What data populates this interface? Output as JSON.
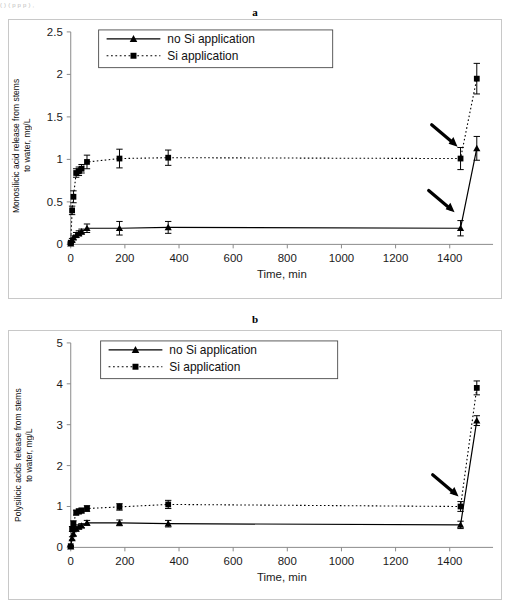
{
  "page": {
    "cut_off_header_text": "(  )              (                                                                           p               p                                  p                                                                 )   ,       "
  },
  "panels": [
    {
      "label": "a",
      "ylabel_line1": "Monosilicic acid release from stems",
      "ylabel_line2": "to water, mg/L"
    },
    {
      "label": "b",
      "ylabel_line1": "Polysilicic acids release from stems",
      "ylabel_line2": "to water, mg/L"
    }
  ],
  "chart_data": [
    {
      "type": "line",
      "panel": "a",
      "title": "a",
      "xlabel": "Time, min",
      "ylabel": "Monosilicic acid release from stems to water, mg/L",
      "xlim": [
        0,
        1560
      ],
      "ylim": [
        0,
        2.5
      ],
      "xticks": [
        0,
        200,
        400,
        600,
        800,
        1000,
        1200,
        1400
      ],
      "xtick_labels": [
        "0",
        "200",
        "400",
        "600",
        "800",
        "1000",
        "1200",
        "1400"
      ],
      "yticks": [
        0,
        0.5,
        1,
        1.5,
        2,
        2.5
      ],
      "ytick_labels": [
        "0",
        "0.5",
        "1",
        "1.5",
        "2",
        "2.5"
      ],
      "grid": false,
      "legend_position": "upper-left-inside",
      "series": [
        {
          "name": "no Si application",
          "marker": "triangle",
          "line_style": "solid",
          "color": "#000000",
          "x": [
            0,
            5,
            10,
            20,
            30,
            40,
            60,
            180,
            360,
            1440,
            1500
          ],
          "y": [
            0.01,
            0.05,
            0.08,
            0.11,
            0.13,
            0.15,
            0.19,
            0.19,
            0.2,
            0.19,
            1.13
          ],
          "yerr": [
            0.01,
            0.02,
            0.02,
            0.03,
            0.03,
            0.03,
            0.05,
            0.08,
            0.07,
            0.09,
            0.14
          ]
        },
        {
          "name": "Si application",
          "marker": "square",
          "line_style": "dotted",
          "color": "#000000",
          "x": [
            0,
            5,
            10,
            20,
            30,
            40,
            60,
            180,
            360,
            1440,
            1500
          ],
          "y": [
            0.02,
            0.4,
            0.56,
            0.84,
            0.86,
            0.89,
            0.97,
            1.01,
            1.02,
            1.01,
            1.95
          ],
          "yerr": [
            0.01,
            0.05,
            0.07,
            0.05,
            0.05,
            0.05,
            0.08,
            0.11,
            0.09,
            0.13,
            0.18
          ]
        }
      ],
      "annotations": [
        {
          "type": "arrow",
          "points_to": "Si application point at 1440 min",
          "x": 1440,
          "y": 1.01
        },
        {
          "type": "arrow",
          "points_to": "no Si application point at 1440 min",
          "x": 1440,
          "y": 0.19
        }
      ]
    },
    {
      "type": "line",
      "panel": "b",
      "title": "b",
      "xlabel": "Time, min",
      "ylabel": "Polysilicic acids release from stems to water, mg/L",
      "xlim": [
        0,
        1560
      ],
      "ylim": [
        0,
        5
      ],
      "xticks": [
        0,
        200,
        400,
        600,
        800,
        1000,
        1200,
        1400
      ],
      "xtick_labels": [
        "0",
        "200",
        "400",
        "600",
        "800",
        "1000",
        "1200",
        "1400"
      ],
      "yticks": [
        0,
        1,
        2,
        3,
        4,
        5
      ],
      "ytick_labels": [
        "0",
        "1",
        "2",
        "3",
        "4",
        "5"
      ],
      "grid": false,
      "legend_position": "upper-left-inside",
      "series": [
        {
          "name": "no Si application",
          "marker": "triangle",
          "line_style": "solid",
          "color": "#000000",
          "x": [
            0,
            5,
            10,
            20,
            30,
            40,
            60,
            180,
            360,
            1440,
            1500
          ],
          "y": [
            0.02,
            0.22,
            0.33,
            0.45,
            0.5,
            0.53,
            0.6,
            0.6,
            0.58,
            0.55,
            3.1
          ],
          "yerr": [
            0.01,
            0.04,
            0.05,
            0.05,
            0.05,
            0.05,
            0.06,
            0.07,
            0.08,
            0.09,
            0.12
          ]
        },
        {
          "name": "Si application",
          "marker": "square",
          "line_style": "dotted",
          "color": "#000000",
          "x": [
            0,
            5,
            10,
            20,
            30,
            40,
            60,
            180,
            360,
            1440,
            1500
          ],
          "y": [
            0.03,
            0.45,
            0.58,
            0.85,
            0.88,
            0.9,
            0.95,
            0.99,
            1.05,
            1.0,
            3.9
          ],
          "yerr": [
            0.01,
            0.06,
            0.07,
            0.06,
            0.06,
            0.06,
            0.07,
            0.08,
            0.1,
            0.12,
            0.17
          ]
        }
      ],
      "annotations": [
        {
          "type": "arrow",
          "points_to": "points at 1440 min",
          "x": 1440,
          "y": 1.0
        }
      ]
    }
  ],
  "legend": {
    "items": [
      {
        "label": "no Si application",
        "marker": "triangle",
        "line_style": "solid"
      },
      {
        "label": "Si application",
        "marker": "square",
        "line_style": "dotted"
      }
    ]
  },
  "axis_titles": {
    "x": "Time, min"
  },
  "colors": {
    "ink": "#000000",
    "axis": "#8a8a8a",
    "frame": "#c8c8c8"
  }
}
